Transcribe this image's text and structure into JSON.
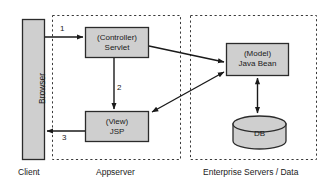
{
  "diagram": {
    "zones": [
      {
        "id": "client",
        "caption": "Client",
        "style": "solid-none"
      },
      {
        "id": "appserver",
        "caption": "Appserver",
        "style": "dashed"
      },
      {
        "id": "enterprise",
        "caption": "Enterprise Servers / Data",
        "style": "dashed"
      }
    ],
    "nodes": [
      {
        "id": "browser",
        "label": "Browser",
        "shape": "rect-vertical-text",
        "fill": "#cfcfcf",
        "stroke": "#2b2b2b"
      },
      {
        "id": "controller",
        "line1": "(Controller)",
        "line2": "Servlet",
        "shape": "rect",
        "fill": "#cfcfcf",
        "stroke": "#2b2b2b"
      },
      {
        "id": "view",
        "line1": "(View)",
        "line2": "JSP",
        "shape": "rect",
        "fill": "#cfcfcf",
        "stroke": "#2b2b2b"
      },
      {
        "id": "model",
        "line1": "(Model)",
        "line2": "Java Bean",
        "shape": "rect",
        "fill": "#cfcfcf",
        "stroke": "#2b2b2b"
      },
      {
        "id": "db",
        "label": "DB",
        "shape": "cylinder",
        "fill": "#cfcfcf",
        "stroke": "#2b2b2b"
      }
    ],
    "edges": [
      {
        "id": "e1",
        "from": "browser",
        "to": "controller",
        "label": "1",
        "heads": "single"
      },
      {
        "id": "e2",
        "from": "controller",
        "to": "view",
        "label": "2",
        "heads": "single"
      },
      {
        "id": "e3",
        "from": "view",
        "to": "browser",
        "label": "3",
        "heads": "single"
      },
      {
        "id": "e4",
        "from": "controller",
        "to": "model",
        "label": "",
        "heads": "single"
      },
      {
        "id": "e5",
        "from": "view",
        "to": "model",
        "label": "",
        "heads": "double"
      },
      {
        "id": "e6",
        "from": "model",
        "to": "db",
        "label": "",
        "heads": "double"
      }
    ],
    "colors": {
      "node_fill": "#cfcfcf",
      "node_stroke": "#2b2b2b",
      "arrow": "#1a1a1a",
      "zone_border": "#3a3a3a",
      "background": "#ffffff"
    }
  }
}
